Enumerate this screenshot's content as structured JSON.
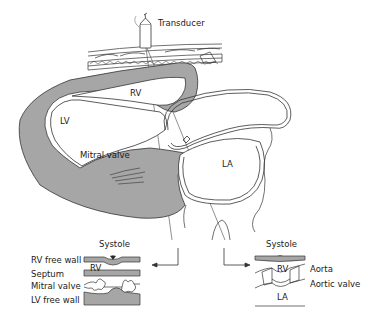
{
  "diagram": {
    "labels": {
      "transducer": "Transducer",
      "rv": "RV",
      "lv": "LV",
      "mitral_valve": "Mitral valve",
      "la": "LA"
    },
    "left_inset": {
      "systole": "Systole",
      "rv_free_wall": "RV free wall",
      "rv": "RV",
      "septum": "Septum",
      "mitral_valve": "Mitral valve",
      "lv_free_wall": "LV free wall"
    },
    "right_inset": {
      "systole": "Systole",
      "rv": "RV",
      "aorta": "Aorta",
      "aortic_valve": "Aortic valve",
      "la": "LA"
    },
    "colors": {
      "muscle_fill": "#a6a6a6",
      "line": "#333333",
      "background": "#ffffff"
    }
  }
}
